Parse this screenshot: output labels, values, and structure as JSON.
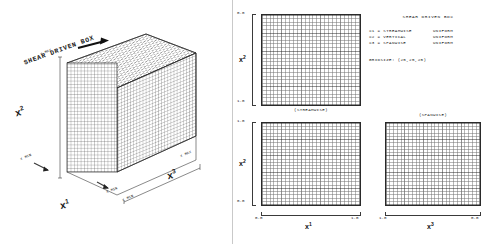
{
  "figure": {
    "title": "SHEAR DRIVEN BOX",
    "left_panel": {
      "title": "SHEAR DRIVEN BOX",
      "axes": [
        {
          "name": "x1",
          "label": "x",
          "sup": "1"
        },
        {
          "name": "x2",
          "label": "x",
          "sup": "2"
        },
        {
          "name": "x3",
          "label": "x",
          "sup": "3"
        }
      ],
      "annotations": [
        {
          "name": "x2-max",
          "text": "X  MAX"
        },
        {
          "name": "x2-min",
          "text": "X  MIN"
        },
        {
          "name": "x1-min",
          "text": "X  MIN"
        },
        {
          "name": "x3-min",
          "text": "X  MIN"
        },
        {
          "name": "x3-max",
          "text": "X  MAX"
        }
      ]
    },
    "info": {
      "title": "SHEAR DRIVEN BOX",
      "rows": [
        {
          "key": "X1 = STREAMWISE",
          "value": "UNIFORM"
        },
        {
          "key": "X2 = VERTICAL",
          "value": "UNIFORM"
        },
        {
          "key": "X3 = SPANWISE",
          "value": "UNIFORM"
        }
      ],
      "gridsize_label": "GRIDSIZE:  (25,25,25)"
    },
    "plots": [
      {
        "name": "streamwise-vertical-plot",
        "caption": "(STREAMWISE)",
        "x_axis": {
          "label": "x",
          "sup": "1",
          "min": "0.0",
          "max": "1.0",
          "reversed": false,
          "visible_ticks": false
        },
        "y_axis": {
          "label": "x",
          "sup": "2",
          "min": "0.0",
          "max": "1.0",
          "reversed": true,
          "top_tick": "0.0",
          "bottom_tick": "1.0"
        }
      },
      {
        "name": "x1-x2-plot",
        "caption": "",
        "x_axis": {
          "label": "x",
          "sup": "1",
          "min": "0.0",
          "max": "1.0",
          "reversed": false,
          "visible_ticks": true
        },
        "y_axis": {
          "label": "x",
          "sup": "2",
          "min": "0.0",
          "max": "1.0",
          "reversed": false,
          "top_tick": "1.0",
          "bottom_tick": "0.0"
        }
      },
      {
        "name": "spanwise-plot",
        "caption": "(SPANWISE)",
        "x_axis": {
          "label": "x",
          "sup": "3",
          "min": "0.0",
          "max": "1.0",
          "reversed": true,
          "left_tick": "1.0",
          "right_tick": "0.0",
          "visible_ticks": true
        },
        "y_axis": {
          "label": "",
          "sup": "",
          "min": "0.0",
          "max": "1.0",
          "reversed": false,
          "top_tick": "",
          "bottom_tick": ""
        }
      }
    ],
    "grid": {
      "nx": 25,
      "ny": 25,
      "nz": 25,
      "line_color": "#3b3b3b",
      "major_every": 5
    },
    "colors": {
      "ink": "#1a1a1a",
      "grid": "#3b3b3b",
      "paper": "#ffffff"
    }
  }
}
